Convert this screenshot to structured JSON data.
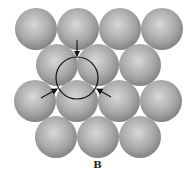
{
  "diagram": {
    "label": "B",
    "colors": {
      "sphere_highlight": "#d8d8d8",
      "sphere_mid": "#a8a8a8",
      "sphere_shadow": "#7a7a7a",
      "outline": "#111111"
    },
    "sphere_radius": 21,
    "rows": [
      {
        "y": 29,
        "x": [
          36,
          78,
          120,
          162
        ]
      },
      {
        "y": 65,
        "x": [
          57,
          98,
          140
        ]
      },
      {
        "y": 101,
        "x": [
          35,
          77,
          119,
          161
        ]
      },
      {
        "y": 137,
        "x": [
          56,
          98,
          140
        ]
      }
    ],
    "circle": {
      "cx": 77,
      "cy": 78,
      "r": 21
    },
    "arrows": [
      {
        "name": "top",
        "x1": 77,
        "y1": 40,
        "x2": 77,
        "y2": 56
      },
      {
        "name": "left",
        "x1": 41,
        "y1": 98,
        "x2": 57,
        "y2": 89
      },
      {
        "name": "right",
        "x1": 111,
        "y1": 97,
        "x2": 97,
        "y2": 89
      }
    ]
  }
}
